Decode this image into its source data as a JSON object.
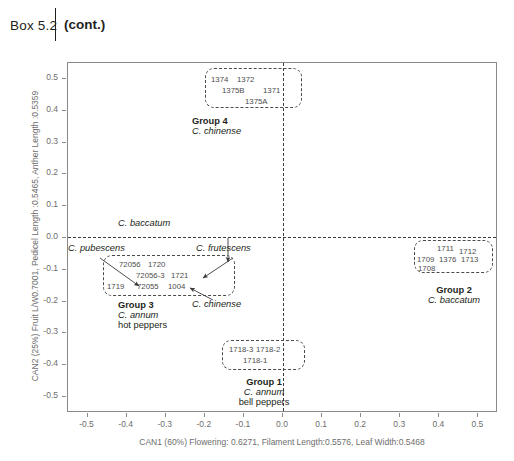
{
  "header": {
    "box_label": "Box 5.2",
    "cont_label": "(cont.)"
  },
  "chart_data": {
    "type": "scatter",
    "title": "",
    "xlabel": "CAN1 (60%) Flowering: 0.6271, Filament Length:0.5576, Leaf Width:0.5468",
    "ylabel": "CAN2 (25%) Fruit L/W0.7001, Pedicel Length :0.5465, Anther Length :0.5359",
    "xlim": [
      -0.55,
      0.55
    ],
    "ylim": [
      -0.55,
      0.55
    ],
    "grid": false,
    "legend": "none",
    "xticks": [
      "-0.5",
      "-0.4",
      "-0.3",
      "-0.2",
      "-0.1",
      "0.0",
      "0.1",
      "0.2",
      "0.3",
      "0.4",
      "0.5"
    ],
    "yticks": [
      "0.5",
      "0.4",
      "0.3",
      "0.2",
      "0.1",
      "0.0",
      "-0.1",
      "-0.2",
      "-0.3",
      "-0.4",
      "-0.5"
    ],
    "xtick_values": [
      -0.5,
      -0.4,
      -0.3,
      -0.2,
      -0.1,
      0.0,
      0.1,
      0.2,
      0.3,
      0.4,
      0.5
    ],
    "ytick_values": [
      0.5,
      0.4,
      0.3,
      0.2,
      0.1,
      0.0,
      -0.1,
      -0.2,
      -0.3,
      -0.4,
      -0.5
    ],
    "reference_lines": [
      {
        "axis": "x",
        "value": 0.0,
        "style": "dashed"
      },
      {
        "axis": "y",
        "value": 0.0,
        "style": "dashed"
      }
    ],
    "clusters": [
      {
        "id": "group-4",
        "group": "Group 4",
        "species": "C. chinense",
        "common": "",
        "accessions": [
          "1374",
          "1372",
          "1375B",
          "1371",
          "1375A"
        ],
        "points": [
          {
            "label": "1374",
            "x": -0.185,
            "y": 0.47
          },
          {
            "label": "1372",
            "x": -0.12,
            "y": 0.47
          },
          {
            "label": "1375B",
            "x": -0.15,
            "y": 0.442
          },
          {
            "label": "1371",
            "x": -0.048,
            "y": 0.442
          },
          {
            "label": "1375A",
            "x": -0.082,
            "y": 0.413
          }
        ]
      },
      {
        "id": "group-2",
        "group": "Group 2",
        "species": "C. baccatum",
        "common": "",
        "accessions": [
          "1711",
          "1712",
          "1709",
          "1376",
          "1713",
          "1708"
        ],
        "points": [
          {
            "label": "1711",
            "x": 0.375,
            "y": -0.108
          },
          {
            "label": "1712",
            "x": 0.43,
            "y": -0.115
          },
          {
            "label": "1709",
            "x": 0.332,
            "y": -0.14
          },
          {
            "label": "1376",
            "x": 0.385,
            "y": -0.14
          },
          {
            "label": "1713",
            "x": 0.437,
            "y": -0.14
          },
          {
            "label": "1708",
            "x": 0.33,
            "y": -0.162
          }
        ]
      },
      {
        "id": "group-3",
        "group": "Group 3",
        "species": "C. annum",
        "common": "hot peppers",
        "accessions": [
          "72056",
          "1720",
          "72056-3",
          "1721",
          "1719",
          "72055",
          "1004"
        ],
        "points": [
          {
            "label": "72056",
            "x": -0.323,
            "y": -0.118
          },
          {
            "label": "1720",
            "x": -0.263,
            "y": -0.118
          },
          {
            "label": "72056-3",
            "x": -0.25,
            "y": -0.152
          },
          {
            "label": "1721",
            "x": -0.19,
            "y": -0.152
          },
          {
            "label": "1719",
            "x": -0.345,
            "y": -0.185
          },
          {
            "label": "72055",
            "x": -0.278,
            "y": -0.185
          },
          {
            "label": "1004",
            "x": -0.215,
            "y": -0.185
          }
        ]
      },
      {
        "id": "group-1",
        "group": "Group 1",
        "species": "C. annum",
        "common": "bell peppers",
        "accessions": [
          "1718-3",
          "1718-2",
          "1718-1"
        ],
        "points": [
          {
            "label": "1718-3",
            "x": -0.093,
            "y": -0.335
          },
          {
            "label": "1718-2",
            "x": -0.03,
            "y": -0.335
          },
          {
            "label": "1718-1",
            "x": -0.055,
            "y": -0.365
          }
        ]
      }
    ],
    "annotations": [
      {
        "text": "C. baccatum",
        "x": -0.215,
        "y": 0.025
      },
      {
        "text": "C. pubescens",
        "x": -0.52,
        "y": -0.055
      },
      {
        "text": "C. frutescens",
        "x": -0.16,
        "y": -0.055
      },
      {
        "text": "C. chinense",
        "x": -0.13,
        "y": -0.232
      }
    ]
  }
}
